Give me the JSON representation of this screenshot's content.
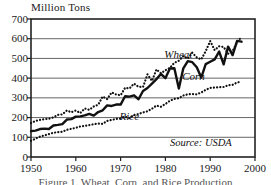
{
  "chart_data": {
    "type": "line",
    "title": "",
    "ylabel": "Million Tons",
    "xlabel": "",
    "ylim": [
      0,
      700
    ],
    "xlim": [
      1950,
      2000
    ],
    "grid": true,
    "legend_position": "inline-annotations",
    "source_note": "Source: USDA",
    "caption": "Figure 1. Wheat, Corn, and Rice Production",
    "yticks": [
      0,
      100,
      200,
      300,
      400,
      500,
      600,
      700
    ],
    "ytick_labels": [
      "0",
      "100",
      "200",
      "300",
      "400",
      "500",
      "600",
      "700"
    ],
    "xticks": [
      1950,
      1960,
      1970,
      1980,
      1990,
      2000
    ],
    "xtick_labels": [
      "1950",
      "1960",
      "1970",
      "1980",
      "1990",
      "2000"
    ],
    "x": [
      1950,
      1951,
      1952,
      1953,
      1954,
      1955,
      1956,
      1957,
      1958,
      1959,
      1960,
      1961,
      1962,
      1963,
      1964,
      1965,
      1966,
      1967,
      1968,
      1969,
      1970,
      1971,
      1972,
      1973,
      1974,
      1975,
      1976,
      1977,
      1978,
      1979,
      1980,
      1981,
      1982,
      1983,
      1984,
      1985,
      1986,
      1987,
      1988,
      1989,
      1990,
      1991,
      1992,
      1993,
      1994,
      1995,
      1996,
      1997
    ],
    "series": [
      {
        "name": "Corn",
        "style": "solid-thick",
        "color": "#111111",
        "label_x": 1990,
        "label_y": 410,
        "values": [
          131,
          134,
          142,
          144,
          142,
          160,
          163,
          167,
          190,
          192,
          205,
          206,
          211,
          219,
          210,
          228,
          237,
          262,
          259,
          266,
          266,
          308,
          306,
          313,
          293,
          335,
          350,
          372,
          395,
          421,
          400,
          449,
          450,
          347,
          450,
          486,
          481,
          455,
          403,
          471,
          483,
          495,
          535,
          470,
          560,
          517,
          589,
          585
        ]
      },
      {
        "name": "Wheat",
        "style": "dotted",
        "color": "#111111",
        "label_x": 1986,
        "label_y": 520,
        "values": [
          172,
          183,
          188,
          192,
          194,
          201,
          214,
          216,
          236,
          227,
          236,
          223,
          246,
          239,
          256,
          265,
          307,
          294,
          328,
          317,
          313,
          351,
          348,
          372,
          356,
          355,
          419,
          386,
          444,
          425,
          440,
          452,
          478,
          488,
          512,
          499,
          529,
          505,
          495,
          537,
          588,
          542,
          562,
          558,
          524,
          538,
          581,
          610
        ]
      },
      {
        "name": "Rice",
        "style": "dotted",
        "color": "#111111",
        "label_x": 1976,
        "label_y": 205,
        "values": [
          82,
          93,
          103,
          110,
          116,
          123,
          126,
          128,
          138,
          143,
          148,
          155,
          158,
          162,
          166,
          170,
          168,
          183,
          188,
          193,
          195,
          204,
          197,
          213,
          218,
          226,
          232,
          245,
          261,
          255,
          269,
          285,
          295,
          298,
          312,
          318,
          319,
          318,
          327,
          341,
          350,
          352,
          354,
          355,
          364,
          366,
          378,
          382
        ]
      }
    ]
  },
  "plot_geometry": {
    "left": 31,
    "right": 255,
    "top": 19,
    "bottom": 157
  }
}
